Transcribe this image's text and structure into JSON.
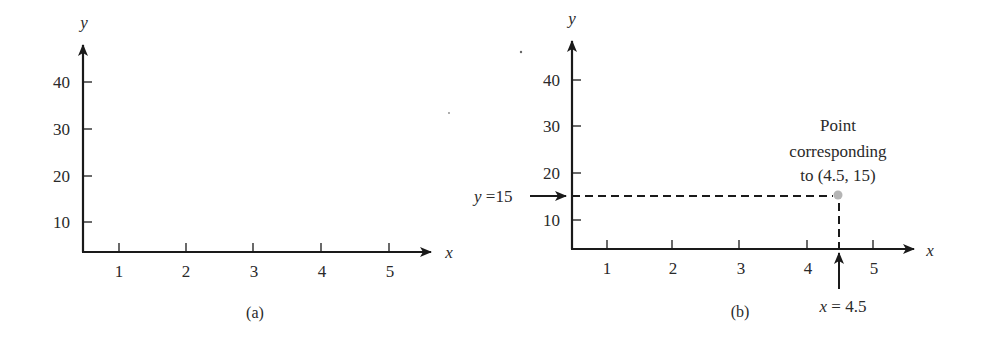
{
  "colors": {
    "ink": "#1a1a1a",
    "text": "#2a2a2a",
    "point": "#b5b5b5",
    "background": "#ffffff"
  },
  "panels": [
    {
      "id": "a",
      "caption": "(a)",
      "x_axis_label": "x",
      "y_axis_label": "y",
      "x_ticks": [
        "1",
        "2",
        "3",
        "4",
        "5"
      ],
      "y_ticks": [
        "10",
        "20",
        "30",
        "40"
      ]
    },
    {
      "id": "b",
      "caption": "(b)",
      "x_axis_label": "x",
      "y_axis_label": "y",
      "x_ticks": [
        "1",
        "2",
        "3",
        "4",
        "5"
      ],
      "y_ticks": [
        "10",
        "20",
        "30",
        "40"
      ],
      "point": {
        "x": 4.5,
        "y": 15
      },
      "annotations": {
        "y_marker": "y =15",
        "x_marker": "x = 4.5",
        "point_label_line1": "Point",
        "point_label_line2": "corresponding",
        "point_label_line3": "to (4.5, 15)"
      }
    }
  ],
  "chart_data": [
    {
      "type": "scatter",
      "title": "(a)",
      "xlabel": "x",
      "ylabel": "y",
      "x_ticks": [
        1,
        2,
        3,
        4,
        5
      ],
      "y_ticks": [
        10,
        20,
        30,
        40
      ],
      "xlim": [
        0.5,
        5.6
      ],
      "ylim": [
        3,
        48
      ],
      "grid": false,
      "series": []
    },
    {
      "type": "scatter",
      "title": "(b)",
      "xlabel": "x",
      "ylabel": "y",
      "x_ticks": [
        1,
        2,
        3,
        4,
        5
      ],
      "y_ticks": [
        10,
        20,
        30,
        40
      ],
      "xlim": [
        0.5,
        5.6
      ],
      "ylim": [
        3,
        48
      ],
      "grid": false,
      "series": [
        {
          "name": "Point corresponding to (4.5, 15)",
          "x": [
            4.5
          ],
          "y": [
            15
          ]
        }
      ],
      "annotations": [
        {
          "text": "y =15",
          "target": "y-axis at 15",
          "style": "arrow + dashed line"
        },
        {
          "text": "x = 4.5",
          "target": "x-axis at 4.5",
          "style": "arrow + dashed line"
        },
        {
          "text": "Point corresponding to (4.5, 15)",
          "target": [
            4.5,
            15
          ]
        }
      ]
    }
  ]
}
